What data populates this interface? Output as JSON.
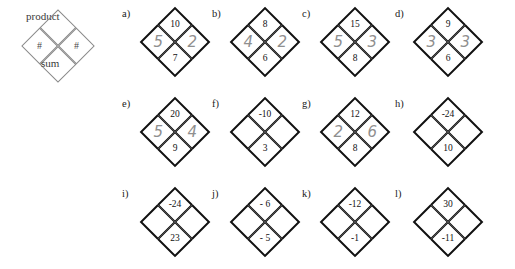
{
  "legend": {
    "name": "number-diamond-key",
    "top_label": "product",
    "bottom_label": "sum",
    "left_label": "#",
    "right_label": "#"
  },
  "puzzles": [
    {
      "tag": "a)",
      "top": "10",
      "bottom": "7",
      "left": "5",
      "right": "2",
      "answered": true
    },
    {
      "tag": "b)",
      "top": "8",
      "bottom": "6",
      "left": "4",
      "right": "2",
      "answered": true
    },
    {
      "tag": "c)",
      "top": "15",
      "bottom": "8",
      "left": "5",
      "right": "3",
      "answered": true
    },
    {
      "tag": "d)",
      "top": "9",
      "bottom": "6",
      "left": "3",
      "right": "3",
      "answered": true
    },
    {
      "tag": "e)",
      "top": "20",
      "bottom": "9",
      "left": "5",
      "right": "4",
      "answered": true
    },
    {
      "tag": "f)",
      "top": "-10",
      "bottom": "3",
      "left": "",
      "right": "",
      "answered": false
    },
    {
      "tag": "g)",
      "top": "12",
      "bottom": "8",
      "left": "2",
      "right": "6",
      "answered": true
    },
    {
      "tag": "h)",
      "top": "-24",
      "bottom": "10",
      "left": "",
      "right": "",
      "answered": false
    },
    {
      "tag": "i)",
      "top": "-24",
      "bottom": "23",
      "left": "",
      "right": "",
      "answered": false
    },
    {
      "tag": "j)",
      "top": "- 6",
      "bottom": "- 5",
      "left": "",
      "right": "",
      "answered": false
    },
    {
      "tag": "k)",
      "top": "-12",
      "bottom": "-1",
      "left": "",
      "right": "",
      "answered": false
    },
    {
      "tag": "l)",
      "top": "30",
      "bottom": "-11",
      "left": "",
      "right": "",
      "answered": false
    }
  ],
  "colors": {
    "ink": "#111111",
    "handwriting": "#8f8f8f",
    "legend_line": "#8a8a8a",
    "background": "#ffffff"
  }
}
